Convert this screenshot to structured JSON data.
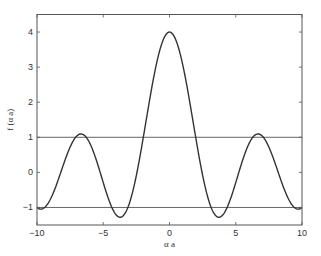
{
  "chart_data": {
    "type": "line",
    "title": "",
    "xlabel": "α a",
    "ylabel": "f (α a)",
    "xlim": [
      -10,
      10
    ],
    "ylim": [
      -1.5,
      4.5
    ],
    "xticks": [
      -10,
      -5,
      0,
      5,
      10
    ],
    "xtick_labels": [
      "−10",
      "−5",
      "0",
      "5",
      "10"
    ],
    "yticks": [
      -1,
      0,
      1,
      2,
      3,
      4
    ],
    "ytick_labels": [
      "−1",
      "0",
      "1",
      "2",
      "3",
      "4"
    ],
    "grid": false,
    "legend": null,
    "series": [
      {
        "name": "f(αa) = 3·sin(αa)/(αa) + cos(αa)",
        "x": [
          -10,
          -9.5,
          -9,
          -8.5,
          -8,
          -7.5,
          -7,
          -6.5,
          -6,
          -5.5,
          -5,
          -4.5,
          -4,
          -3.5,
          -3,
          -2.5,
          -2,
          -1.5,
          -1,
          -0.5,
          0,
          0.5,
          1,
          1.5,
          2,
          2.5,
          3,
          3.5,
          4,
          4.5,
          5,
          5.5,
          6,
          6.5,
          7,
          7.5,
          8,
          8.5,
          9,
          9.5,
          10
        ],
        "values": [
          -1.0,
          -0.94,
          -0.95,
          -0.69,
          -0.26,
          0.22,
          0.72,
          1.07,
          1.1,
          0.67,
          0.08,
          -0.52,
          -1.22,
          -1.24,
          -0.85,
          -0.08,
          0.95,
          2.07,
          3.06,
          3.75,
          4.0,
          3.75,
          3.06,
          2.07,
          0.95,
          -0.08,
          -0.85,
          -1.24,
          -1.22,
          -0.52,
          0.08,
          0.67,
          1.1,
          1.07,
          0.72,
          0.22,
          -0.26,
          -0.69,
          -0.95,
          -0.94,
          -1.0
        ],
        "color": "#333333"
      },
      {
        "name": "upper bound f = 1",
        "x": [
          -10,
          10
        ],
        "values": [
          1,
          1
        ],
        "color": "#555555"
      },
      {
        "name": "lower bound f = -1",
        "x": [
          -10,
          10
        ],
        "values": [
          -1,
          -1
        ],
        "color": "#555555"
      }
    ]
  },
  "labels": {
    "x_axis": "α a",
    "y_axis": "f (α a)"
  }
}
